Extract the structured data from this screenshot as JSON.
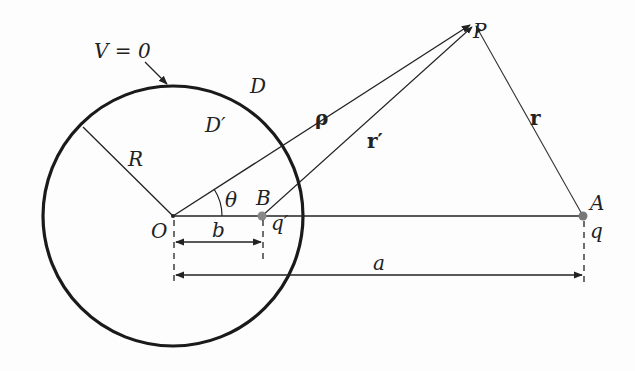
{
  "diagram": {
    "labels": {
      "potential": "V = 0",
      "outer_region": "D",
      "inner_region": "D′",
      "radius": "R",
      "angle": "θ",
      "origin": "O",
      "image_point": "B",
      "image_charge": "q′",
      "charge_point": "A",
      "charge": "q",
      "field_point": "P",
      "rho": "ρ",
      "r_prime": "r′",
      "r": "r",
      "dist_b": "b",
      "dist_a": "a"
    },
    "colors": {
      "ink": "#222222",
      "sphere": "#1a1a1a",
      "point": "#888888",
      "background": "#fdfdfd"
    }
  }
}
